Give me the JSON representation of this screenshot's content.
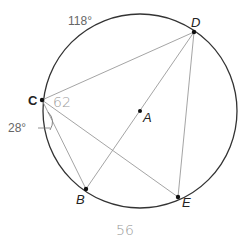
{
  "figure": {
    "circle": {
      "cx": 140,
      "cy": 111,
      "r": 97,
      "stroke": "#333333"
    },
    "center_label": "A",
    "points": [
      {
        "name": "C",
        "x": 42,
        "y": 100
      },
      {
        "name": "D",
        "x": 194,
        "y": 32
      },
      {
        "name": "B",
        "x": 86,
        "y": 189
      },
      {
        "name": "E",
        "x": 178,
        "y": 197
      },
      {
        "name": "A",
        "x": 140,
        "y": 111
      }
    ],
    "segments": [
      [
        "C",
        "D"
      ],
      [
        "C",
        "B"
      ],
      [
        "C",
        "E"
      ],
      [
        "D",
        "B"
      ],
      [
        "D",
        "E"
      ]
    ],
    "labels": {
      "C": "C",
      "D": "D",
      "A": "A",
      "B": "B",
      "E": "E"
    },
    "annotations": {
      "arc_measure": "118°",
      "angle_measure": "28°",
      "handwritten_62": "62",
      "handwritten_56": "56"
    },
    "colors": {
      "circle": "#333333",
      "chord": "#9a9a9a",
      "point": "#111111",
      "handwriting": "#9a9a9a"
    }
  }
}
